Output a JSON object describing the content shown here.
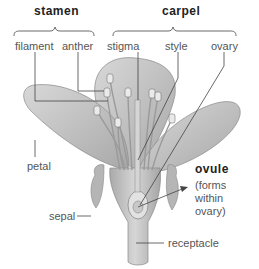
{
  "diagram": {
    "groups": [
      {
        "name": "stamen",
        "label": "stamen",
        "parts": [
          "filament",
          "anther"
        ]
      },
      {
        "name": "carpel",
        "label": "carpel",
        "parts": [
          "stigma",
          "style",
          "ovary"
        ]
      }
    ],
    "labels": {
      "stamen": "stamen",
      "carpel": "carpel",
      "filament": "filament",
      "anther": "anther",
      "stigma": "stigma",
      "style": "style",
      "ovary": "ovary",
      "petal": "petal",
      "ovule": "ovule",
      "ovule_note_1": "(forms",
      "ovule_note_2": "within",
      "ovule_note_3": "ovary)",
      "sepal": "sepal",
      "receptacle": "receptacle"
    },
    "colors": {
      "petal": "#c9c9c9",
      "petal_dark": "#9a9a9a",
      "stem": "#bdbdbd",
      "line": "#444444",
      "text": "#555555",
      "heading": "#222222"
    }
  }
}
